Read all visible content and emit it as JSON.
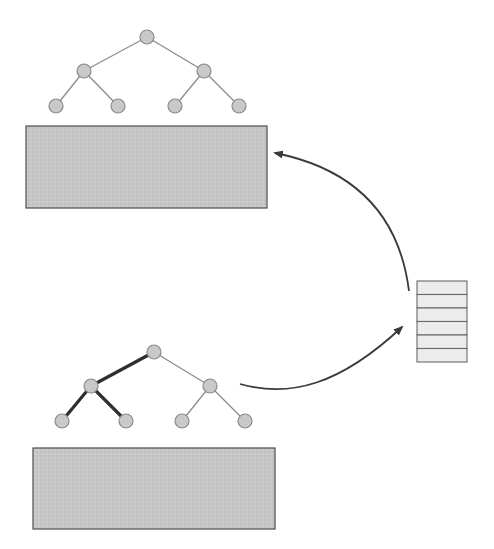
{
  "diagram": {
    "colors": {
      "background": "#ffffff",
      "node_fill": "#c9c9c9",
      "node_stroke": "#8a8a8a",
      "edge_thin": "#8c8c8c",
      "edge_thick": "#2e2e2e",
      "block_fill": "#c6c6c6",
      "block_stroke": "#5a5a5a",
      "stack_fill": "#ececec",
      "stack_stroke": "#6a6a6a",
      "arrow": "#3a3a3a"
    },
    "top_tree": {
      "nodes": [
        {
          "id": "r",
          "x": 147,
          "y": 37
        },
        {
          "id": "l",
          "x": 84,
          "y": 71
        },
        {
          "id": "rr",
          "x": 204,
          "y": 71
        },
        {
          "id": "ll",
          "x": 56,
          "y": 106
        },
        {
          "id": "lr",
          "x": 118,
          "y": 106
        },
        {
          "id": "rl",
          "x": 175,
          "y": 106
        },
        {
          "id": "rrr",
          "x": 239,
          "y": 106
        }
      ],
      "edges": [
        {
          "from": "r",
          "to": "l",
          "highlight": false
        },
        {
          "from": "r",
          "to": "rr",
          "highlight": false
        },
        {
          "from": "l",
          "to": "ll",
          "highlight": false
        },
        {
          "from": "l",
          "to": "lr",
          "highlight": false
        },
        {
          "from": "rr",
          "to": "rl",
          "highlight": false
        },
        {
          "from": "rr",
          "to": "rrr",
          "highlight": false
        }
      ]
    },
    "top_block": {
      "x": 26,
      "y": 126,
      "width": 241,
      "height": 82
    },
    "bottom_tree": {
      "nodes": [
        {
          "id": "r",
          "x": 154,
          "y": 352
        },
        {
          "id": "l",
          "x": 91,
          "y": 386
        },
        {
          "id": "rr",
          "x": 210,
          "y": 386
        },
        {
          "id": "ll",
          "x": 62,
          "y": 421
        },
        {
          "id": "lr",
          "x": 126,
          "y": 421
        },
        {
          "id": "rl",
          "x": 182,
          "y": 421
        },
        {
          "id": "rrr",
          "x": 245,
          "y": 421
        }
      ],
      "edges": [
        {
          "from": "r",
          "to": "l",
          "highlight": true
        },
        {
          "from": "r",
          "to": "rr",
          "highlight": false
        },
        {
          "from": "l",
          "to": "ll",
          "highlight": true
        },
        {
          "from": "l",
          "to": "lr",
          "highlight": true
        },
        {
          "from": "rr",
          "to": "rl",
          "highlight": false
        },
        {
          "from": "rr",
          "to": "rrr",
          "highlight": false
        }
      ]
    },
    "bottom_block": {
      "x": 33,
      "y": 448,
      "width": 242,
      "height": 81
    },
    "stack": {
      "x": 417,
      "y": 281,
      "width": 50,
      "height": 81,
      "rows": 6
    },
    "arrows": [
      {
        "name": "tree-to-stack-arrow",
        "path": "M 240 384 C 290 398, 340 385, 402 327"
      },
      {
        "name": "stack-to-block-arrow",
        "path": "M 409 291 C 400 220, 360 170, 275 153"
      }
    ]
  }
}
